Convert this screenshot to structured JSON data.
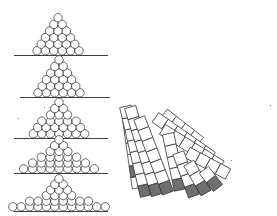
{
  "figure": {
    "background": "#ffffff",
    "stroke_color": "#2a2a2a",
    "shade_color": "#6f6f6f",
    "circle_radius": 4.2,
    "stacks": [
      {
        "label": "stack-1",
        "baseline_y": 55,
        "line_x": [
          14,
          108
        ],
        "center_x": 58,
        "rows": [
          6,
          5,
          4,
          3,
          2,
          1
        ],
        "spread": 1.0,
        "row_step": 6.6
      },
      {
        "label": "stack-2",
        "baseline_y": 97,
        "line_x": [
          20,
          110
        ],
        "center_x": 59,
        "rows": [
          6,
          5,
          4,
          3,
          2,
          1
        ],
        "spread": 1.0,
        "row_step": 6.6
      },
      {
        "label": "stack-3",
        "baseline_y": 138,
        "line_x": [
          14,
          108
        ],
        "center_x": 59,
        "rows": [
          7,
          6,
          5,
          3,
          2,
          1
        ],
        "spread": 1.02,
        "row_step": 6.3
      },
      {
        "label": "stack-4",
        "baseline_y": 173,
        "line_x": [
          14,
          108
        ],
        "center_x": 59,
        "rows": [
          9,
          7,
          5,
          3,
          2,
          1
        ],
        "spread": 1.05,
        "row_step": 5.8
      },
      {
        "label": "stack-5",
        "baseline_y": 211,
        "line_x": [
          14,
          108
        ],
        "center_x": 59,
        "rows": [
          12,
          8,
          4,
          3,
          2,
          1
        ],
        "spread": 1.0,
        "row_step": 5.6
      }
    ],
    "fan": {
      "square_size": 11.5,
      "columns": [
        {
          "x": 138,
          "y": 188,
          "angle": 8,
          "count": 6,
          "shaded": [
            1
          ]
        },
        {
          "x": 146,
          "y": 196,
          "angle": 13,
          "count": 8,
          "shaded": [
            0
          ]
        },
        {
          "x": 157,
          "y": 195,
          "angle": 17,
          "count": 8,
          "shaded": [
            0
          ]
        },
        {
          "x": 168,
          "y": 193,
          "angle": 21,
          "count": 7,
          "shaded": [
            0
          ]
        },
        {
          "x": 180,
          "y": 190,
          "angle": 12,
          "count": 5,
          "shaded": [
            0
          ]
        },
        {
          "x": 194,
          "y": 196,
          "angle": 20,
          "count": 4,
          "shaded": [
            0
          ]
        },
        {
          "x": 206,
          "y": 193,
          "angle": 30,
          "count": 3,
          "shaded": [
            0
          ]
        },
        {
          "x": 218,
          "y": 188,
          "angle": 38,
          "count": 2,
          "shaded": [
            0
          ]
        }
      ],
      "upper_blocks": [
        {
          "x": 200,
          "y": 142,
          "angle": 52,
          "count": 4
        },
        {
          "x": 212,
          "y": 157,
          "angle": 55,
          "count": 6
        },
        {
          "x": 221,
          "y": 166,
          "angle": 58,
          "count": 6
        },
        {
          "x": 228,
          "y": 174,
          "angle": 62,
          "count": 4
        }
      ]
    },
    "specks": [
      [
        44,
        107
      ],
      [
        18,
        118
      ],
      [
        231,
        160
      ],
      [
        270,
        105
      ]
    ]
  }
}
